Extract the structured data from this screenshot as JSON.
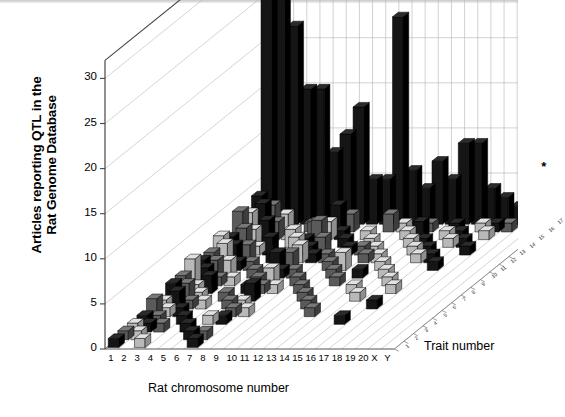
{
  "axes": {
    "y_title": "Articles reporting QTL in the Rat Genome Database",
    "y_title_line1": "Articles reporting QTL in the",
    "y_title_line2": "Rat Genome Database",
    "x_title": "Rat chromosome number",
    "z_title": "Trait number",
    "y_ticks": [
      "0",
      "5",
      "10",
      "15",
      "20",
      "25",
      "30"
    ],
    "x_ticks": [
      "1",
      "2",
      "3",
      "4",
      "5",
      "6",
      "7",
      "8",
      "9",
      "10",
      "11",
      "12",
      "13",
      "14",
      "15",
      "16",
      "17",
      "18",
      "19",
      "20",
      "X",
      "Y"
    ],
    "z_ticks": [
      "1",
      "2",
      "3",
      "4",
      "5",
      "6",
      "7",
      "8",
      "9",
      "10",
      "11",
      "12",
      "13",
      "14",
      "15",
      "16",
      "17"
    ]
  },
  "annotations": {
    "asterisk": "*"
  },
  "colors": {
    "bar_dark": "#1a1a1a",
    "bar_mid": "#5e5e5e",
    "bar_light": "#c8c8c8",
    "grid": "#b8b8b8",
    "axis": "#555555",
    "floor": "#cfcfcf"
  },
  "chart_data": {
    "type": "bar",
    "title": "",
    "xlabel": "Rat chromosome number",
    "ylabel": "Articles reporting QTL in the Rat Genome Database",
    "zlabel": "Trait number",
    "ylim": [
      0,
      32
    ],
    "grid": true,
    "legend": "none",
    "projection": "3d",
    "categories": [
      "1",
      "2",
      "3",
      "4",
      "5",
      "6",
      "7",
      "8",
      "9",
      "10",
      "11",
      "12",
      "13",
      "14",
      "15",
      "16",
      "17",
      "18",
      "19",
      "20",
      "X",
      "Y"
    ],
    "z_categories": [
      "1",
      "2",
      "3",
      "4",
      "5",
      "6",
      "7",
      "8",
      "9",
      "10",
      "11",
      "12",
      "13",
      "14",
      "15",
      "16",
      "17"
    ],
    "note": "Back row (trait 17) carries the tall dark bars; traits 1-16 carry small scattered bars.",
    "series": [
      {
        "name": "trait 17",
        "values": [
          31,
          29,
          22,
          15,
          15,
          8,
          10,
          13,
          5,
          5,
          23,
          6,
          4,
          7,
          5,
          9,
          9,
          4,
          3,
          2,
          2,
          5
        ]
      },
      {
        "name": "trait 16",
        "values": [
          4,
          3,
          2,
          0,
          1,
          0,
          3,
          2,
          0,
          0,
          2,
          1,
          0,
          1,
          0,
          1,
          0,
          1,
          1,
          1,
          0,
          0
        ]
      },
      {
        "name": "trait 15",
        "values": [
          3,
          4,
          2,
          1,
          0,
          2,
          2,
          1,
          0,
          1,
          0,
          0,
          1,
          2,
          0,
          1,
          1,
          0,
          1,
          0,
          0,
          0
        ]
      },
      {
        "name": "trait 14",
        "values": [
          4,
          2,
          3,
          0,
          2,
          1,
          3,
          0,
          1,
          0,
          1,
          0,
          0,
          1,
          1,
          0,
          1,
          1,
          0,
          0,
          0,
          0
        ]
      },
      {
        "name": "trait 13",
        "values": [
          2,
          3,
          1,
          2,
          0,
          2,
          1,
          2,
          0,
          1,
          1,
          1,
          0,
          0,
          1,
          1,
          0,
          0,
          1,
          0,
          0,
          0
        ]
      },
      {
        "name": "trait 12",
        "values": [
          3,
          2,
          2,
          0,
          1,
          1,
          2,
          1,
          1,
          0,
          0,
          1,
          1,
          0,
          0,
          1,
          1,
          0,
          0,
          0,
          0,
          0
        ]
      },
      {
        "name": "trait 11",
        "values": [
          2,
          3,
          1,
          1,
          0,
          2,
          2,
          0,
          0,
          1,
          2,
          0,
          0,
          1,
          0,
          0,
          0,
          1,
          0,
          0,
          0,
          0
        ]
      },
      {
        "name": "trait 10",
        "values": [
          2,
          2,
          2,
          0,
          1,
          0,
          1,
          1,
          0,
          0,
          1,
          0,
          1,
          0,
          1,
          0,
          0,
          0,
          0,
          0,
          0,
          0
        ]
      },
      {
        "name": "trait 9",
        "values": [
          3,
          2,
          1,
          1,
          0,
          1,
          2,
          0,
          1,
          0,
          0,
          1,
          0,
          0,
          0,
          1,
          0,
          0,
          0,
          0,
          0,
          0
        ]
      },
      {
        "name": "trait 8",
        "values": [
          2,
          1,
          2,
          0,
          0,
          1,
          1,
          1,
          0,
          1,
          0,
          0,
          0,
          1,
          0,
          0,
          1,
          0,
          0,
          0,
          0,
          0
        ]
      },
      {
        "name": "trait 7",
        "values": [
          2,
          2,
          1,
          0,
          1,
          0,
          2,
          0,
          0,
          0,
          1,
          0,
          0,
          0,
          1,
          0,
          0,
          0,
          0,
          0,
          0,
          0
        ]
      },
      {
        "name": "trait 6",
        "values": [
          1,
          2,
          1,
          1,
          0,
          1,
          1,
          0,
          0,
          0,
          0,
          1,
          0,
          0,
          0,
          0,
          1,
          0,
          0,
          0,
          0,
          0
        ]
      },
      {
        "name": "trait 5",
        "values": [
          2,
          1,
          1,
          0,
          0,
          0,
          1,
          1,
          0,
          0,
          0,
          0,
          1,
          0,
          0,
          0,
          0,
          0,
          0,
          0,
          0,
          0
        ]
      },
      {
        "name": "trait 4",
        "values": [
          1,
          1,
          0,
          1,
          0,
          1,
          1,
          0,
          0,
          0,
          0,
          0,
          0,
          0,
          0,
          1,
          0,
          0,
          0,
          0,
          0,
          0
        ]
      },
      {
        "name": "trait 3",
        "values": [
          1,
          1,
          1,
          0,
          1,
          0,
          0,
          0,
          0,
          0,
          0,
          0,
          0,
          0,
          0,
          0,
          0,
          0,
          0,
          0,
          0,
          0
        ]
      },
      {
        "name": "trait 2",
        "values": [
          1,
          1,
          0,
          0,
          0,
          1,
          1,
          0,
          0,
          0,
          0,
          0,
          0,
          0,
          0,
          0,
          0,
          0,
          0,
          0,
          0,
          0
        ]
      },
      {
        "name": "trait 1",
        "values": [
          1,
          0,
          1,
          0,
          0,
          0,
          1,
          0,
          0,
          0,
          0,
          0,
          0,
          0,
          0,
          0,
          0,
          0,
          0,
          0,
          0,
          0
        ]
      }
    ]
  }
}
